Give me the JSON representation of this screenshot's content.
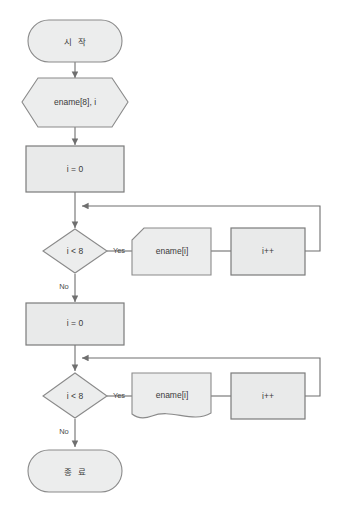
{
  "diagram": {
    "colors": {
      "shape_fill": "#eceded",
      "shape_stroke": "#8a8a8a",
      "connector": "#6f6f6f",
      "text": "#3a3a3a",
      "background": "#ffffff"
    },
    "nodes": {
      "start": {
        "label": "시 작",
        "shape": "terminator"
      },
      "declare": {
        "label": "ename[8], i",
        "shape": "hexagon"
      },
      "init_first": {
        "label": "i = 0",
        "shape": "process"
      },
      "cond_first": {
        "label": "i < 8",
        "shape": "decision"
      },
      "body_first": {
        "label": "ename[i]",
        "shape": "card"
      },
      "incr_first": {
        "label": "i++",
        "shape": "process"
      },
      "init_second": {
        "label": "i = 0",
        "shape": "process"
      },
      "cond_second": {
        "label": "i < 8",
        "shape": "decision"
      },
      "body_second": {
        "label": "ename[i]",
        "shape": "document"
      },
      "incr_second": {
        "label": "i++",
        "shape": "process"
      },
      "end": {
        "label": "종 료",
        "shape": "terminator"
      }
    },
    "edge_labels": {
      "yes_first": "Yes",
      "no_first": "No",
      "yes_second": "Yes",
      "no_second": "No"
    }
  }
}
